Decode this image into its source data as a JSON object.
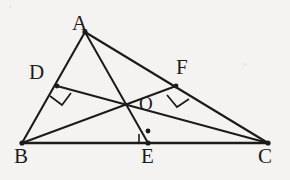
{
  "figure": {
    "kind": "geometry-diagram",
    "background_color": "#f4f3f1",
    "ink_color": "#1c1b1a",
    "width": 290,
    "height": 180
  },
  "labels": {
    "A": "A",
    "B": "B",
    "C": "C",
    "D": "D",
    "E": "E",
    "F": "F",
    "O": "O"
  },
  "points": {
    "A": {
      "x": 85,
      "y": 32,
      "label": "A",
      "marked": true
    },
    "B": {
      "x": 22,
      "y": 143,
      "label": "B",
      "marked": true
    },
    "C": {
      "x": 268,
      "y": 143,
      "label": "C",
      "marked": true
    },
    "D": {
      "x": 57,
      "y": 86,
      "label": "D",
      "marked": true
    },
    "E": {
      "x": 148,
      "y": 143,
      "label": "E",
      "marked": true
    },
    "F": {
      "x": 176,
      "y": 86,
      "label": "F",
      "marked": true
    },
    "O": {
      "x": 148,
      "y": 130,
      "label": "O",
      "marked": true
    }
  },
  "segments": [
    {
      "name": "side-AB",
      "from": "A",
      "to": "B",
      "style": "solid"
    },
    {
      "name": "side-AC",
      "from": "A",
      "to": "C",
      "style": "solid"
    },
    {
      "name": "side-BC",
      "from": "B",
      "to": "C",
      "style": "solid"
    },
    {
      "name": "altitude-AE",
      "from": "A",
      "to": "E",
      "style": "solid"
    },
    {
      "name": "altitude-BF",
      "from": "B",
      "to": "F",
      "style": "solid"
    },
    {
      "name": "altitude-CD",
      "from": "C",
      "to": "D",
      "style": "solid"
    }
  ],
  "right_angles": [
    {
      "name": "right-angle-at-D",
      "vertex": "D",
      "size": 13
    },
    {
      "name": "right-angle-at-E",
      "vertex": "E",
      "size": 9
    },
    {
      "name": "right-angle-at-F",
      "vertex": "F",
      "size": 13
    }
  ]
}
